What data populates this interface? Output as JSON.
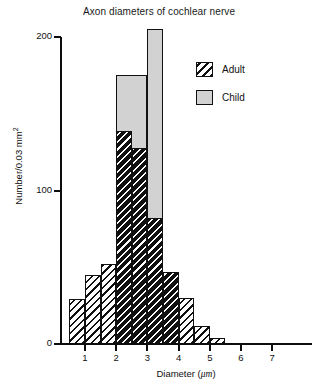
{
  "chart": {
    "title": "Axon diameters of cochlear nerve",
    "x_axis_title_text": "Diameter (",
    "x_axis_title_unit": "μm",
    "x_axis_title_close": ")",
    "y_axis_title_text": "Number/0.03 mm",
    "y_axis_title_exponent": "2"
  },
  "legend": {
    "items": [
      {
        "label": "Adult",
        "swatch": "diagonal-hatch",
        "color": "#ffffff"
      },
      {
        "label": "Child",
        "swatch": "solid-fill",
        "color": "#d2d2d2"
      }
    ]
  },
  "axes": {
    "y_ticks": [
      {
        "value": 0,
        "label": "0"
      },
      {
        "value": 100,
        "label": "100"
      },
      {
        "value": 200,
        "label": "200"
      }
    ],
    "x_ticks": [
      {
        "value": 1,
        "label": "1"
      },
      {
        "value": 2,
        "label": "2"
      },
      {
        "value": 3,
        "label": "3"
      },
      {
        "value": 4,
        "label": "4"
      },
      {
        "value": 5,
        "label": "5"
      },
      {
        "value": 6,
        "label": "6"
      },
      {
        "value": 7,
        "label": "7"
      }
    ]
  },
  "chart_data": {
    "type": "bar",
    "title": "Axon diameters of cochlear nerve",
    "xlabel": "Diameter (μm)",
    "ylabel": "Number/0.03 mm2",
    "xlim": [
      0,
      8
    ],
    "ylim": [
      0,
      210
    ],
    "grid": false,
    "legend_position": "upper-right",
    "bin_width": 0.5,
    "bin_edges": [
      0.5,
      1.0,
      1.5,
      2.0,
      2.5,
      3.0,
      3.5,
      4.0,
      4.5,
      5.0,
      5.5
    ],
    "series": [
      {
        "name": "Adult",
        "style": "diagonal-hatch",
        "values": [
          29,
          45,
          52,
          139,
          128,
          82,
          47,
          30,
          12,
          4
        ]
      },
      {
        "name": "Child",
        "style": "solid-gray",
        "values": [
          0,
          0,
          0,
          175,
          175,
          205,
          0,
          0,
          0,
          0
        ]
      }
    ]
  },
  "bars": {
    "child": [
      {
        "x0": 2.0,
        "x1": 3.0,
        "value": 175
      },
      {
        "x0": 3.0,
        "x1": 3.5,
        "value": 205
      }
    ],
    "adult": [
      {
        "x0": 0.5,
        "x1": 1.0,
        "value": 29,
        "shade": "light"
      },
      {
        "x0": 1.0,
        "x1": 1.5,
        "value": 45,
        "shade": "light"
      },
      {
        "x0": 1.5,
        "x1": 2.0,
        "value": 52,
        "shade": "light"
      },
      {
        "x0": 2.0,
        "x1": 2.5,
        "value": 139,
        "shade": "dark"
      },
      {
        "x0": 2.5,
        "x1": 3.0,
        "value": 128,
        "shade": "dark"
      },
      {
        "x0": 3.0,
        "x1": 3.5,
        "value": 82,
        "shade": "dark"
      },
      {
        "x0": 3.5,
        "x1": 4.0,
        "value": 47,
        "shade": "dark"
      },
      {
        "x0": 4.0,
        "x1": 4.5,
        "value": 30,
        "shade": "light"
      },
      {
        "x0": 4.5,
        "x1": 5.0,
        "value": 12,
        "shade": "light"
      },
      {
        "x0": 5.0,
        "x1": 5.5,
        "value": 4,
        "shade": "light"
      }
    ]
  }
}
